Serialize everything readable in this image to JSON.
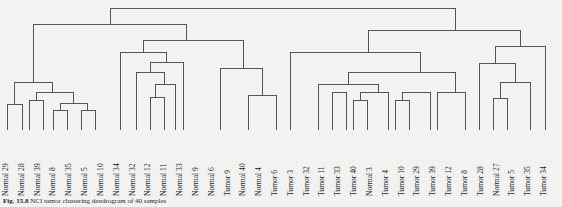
{
  "figure": {
    "kind": "hierarchical-clustering-dendrogram",
    "caption_label": "Fig. 15.8",
    "caption_text": "NCI tumor clustering dendrogram of 40 samples",
    "background_color": "#f2f2f0",
    "line_color": "#555555",
    "label_color": "#1d1d1d"
  },
  "chart_data": {
    "type": "dendrogram",
    "title": "",
    "xlabel": "",
    "ylabel": "",
    "orientation": "top-down",
    "grid": false,
    "legend": "none",
    "leaf_count": 40,
    "leaf_labels": [
      "Normal 29",
      "Normal 28",
      "Normal 39",
      "Normal 8",
      "Normal 35",
      "Normal 5",
      "Normal 10",
      "Normal 34",
      "Normal 32",
      "Normal 12",
      "Normal 11",
      "Normal 33",
      "Normal 9",
      "Normal 6",
      "Tumor 9",
      "Normal 40",
      "Normal 4",
      "Tumor 6",
      "Tumor 3",
      "Tumor 32",
      "Tumor 11",
      "Tumor 33",
      "Tumor 40",
      "Normal 3",
      "Tumor 4",
      "Tumor 10",
      "Tumor 29",
      "Tumor 39",
      "Tumor 12",
      "Tumor 8",
      "Tumor 28",
      "Normal 27",
      "Tumor 5",
      "Tumor 35",
      "Tumor 34"
    ],
    "leaf_groups": {
      "normal": "Normal",
      "tumor": "Tumor"
    },
    "merges": [
      {
        "id": "m1",
        "left": 0,
        "right": 1,
        "height": 0.3
      },
      {
        "id": "m2",
        "left": 2,
        "right": 3,
        "height": 0.24
      },
      {
        "id": "m3",
        "left": 4,
        "right": 5,
        "height": 0.2
      },
      {
        "id": "m4",
        "left": 6,
        "right": 7,
        "height": 0.19
      },
      {
        "id": "m5",
        "left": 8,
        "right": 9,
        "height": 0.26
      },
      {
        "id": "m6",
        "left": 10,
        "right": 11,
        "height": 0.22
      },
      {
        "id": "m7",
        "left": 12,
        "right": 13,
        "height": 0.34
      },
      {
        "id": "m8",
        "left": 14,
        "right": 15,
        "height": 0.3
      },
      {
        "id": "m9",
        "left": 16,
        "right": 17,
        "height": 0.45
      },
      {
        "id": "m10",
        "left": 18,
        "right": 19,
        "height": 0.28
      },
      {
        "id": "m11",
        "left": 20,
        "right": 21,
        "height": 0.27
      },
      {
        "id": "m12",
        "left": 22,
        "right": 23,
        "height": 0.33
      },
      {
        "id": "m13",
        "left": 24,
        "right": 25,
        "height": 0.29
      },
      {
        "id": "root",
        "left": "normal-cluster",
        "right": "tumor-cluster",
        "height": 1.0
      }
    ],
    "clusters": [
      {
        "name": "normal-cluster",
        "label": "Normal samples",
        "leaf_range": [
          0,
          16
        ]
      },
      {
        "name": "tumor-cluster",
        "label": "Tumor samples",
        "leaf_range": [
          17,
          39
        ]
      }
    ],
    "height_range": [
      0,
      1.0
    ]
  }
}
